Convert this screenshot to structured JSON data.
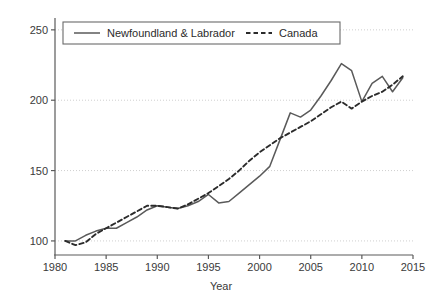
{
  "chart_data": {
    "type": "line",
    "title": "",
    "subtitle": "",
    "xlabel": "Year",
    "ylabel": "",
    "xlim": [
      1980,
      2015
    ],
    "ylim": [
      90,
      257
    ],
    "xticks": [
      1980,
      1985,
      1990,
      1995,
      2000,
      2005,
      2010,
      2015
    ],
    "yticks": [
      100,
      150,
      200,
      250
    ],
    "grid": "horizontal-dotted",
    "legend_position": "top-left-inside",
    "x": [
      1981,
      1982,
      1983,
      1984,
      1985,
      1986,
      1987,
      1988,
      1989,
      1990,
      1991,
      1992,
      1993,
      1994,
      1995,
      1996,
      1997,
      1998,
      1999,
      2000,
      2001,
      2002,
      2003,
      2004,
      2005,
      2006,
      2007,
      2008,
      2009,
      2010,
      2011,
      2012,
      2013,
      2014
    ],
    "series": [
      {
        "name": "Newfoundland & Labrador",
        "style": "solid",
        "color": "#5a5a5a",
        "values": [
          100,
          100,
          104,
          107,
          109,
          109,
          113,
          117,
          122,
          125,
          124,
          123,
          125,
          128,
          133,
          127,
          128,
          134,
          140,
          146,
          153,
          172,
          191,
          188,
          193,
          203,
          214,
          226,
          221,
          199,
          212,
          217,
          206,
          216
        ]
      },
      {
        "name": "Canada",
        "style": "dashed",
        "color": "#2b2b2b",
        "values": [
          100,
          97,
          99,
          105,
          109,
          113,
          117,
          121,
          125,
          125,
          124,
          123,
          126,
          130,
          134,
          139,
          144,
          150,
          157,
          163,
          168,
          173,
          177,
          181,
          185,
          190,
          195,
          199,
          194,
          199,
          203,
          206,
          211,
          217
        ]
      }
    ],
    "xtick_labels": [
      "1980",
      "1985",
      "1990",
      "1995",
      "2000",
      "2005",
      "2010",
      "2015"
    ],
    "ytick_labels": [
      "100",
      "150",
      "200",
      "250"
    ]
  },
  "legend": {
    "items": [
      {
        "label": "Newfoundland & Labrador",
        "style": "solid"
      },
      {
        "label": "Canada",
        "style": "dashed"
      }
    ]
  },
  "colors": {
    "axis": "#5a5a5a",
    "grid": "#cfcfcf",
    "text": "#3a3a3a",
    "series_primary": "#5a5a5a",
    "series_secondary": "#2b2b2b",
    "background": "#ffffff",
    "legend_border": "#6a6a6a"
  }
}
